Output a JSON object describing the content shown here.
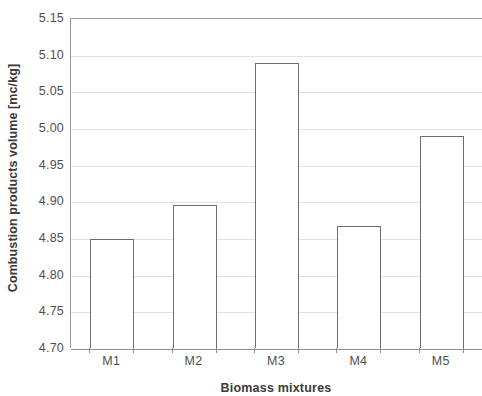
{
  "chart_data": {
    "type": "bar",
    "title": "",
    "subtitle": "",
    "xlabel": "Biomass mixtures",
    "ylabel": "Combustion products volume [mc/kg]",
    "categories": [
      "M1",
      "M2",
      "M3",
      "M4",
      "M5"
    ],
    "values": [
      4.848,
      4.895,
      5.089,
      4.866,
      4.989
    ],
    "ylim": [
      4.7,
      5.15
    ],
    "ytick_values": [
      4.7,
      4.75,
      4.8,
      4.85,
      4.9,
      4.95,
      5.0,
      5.05,
      5.1,
      5.15
    ],
    "ytick_labels": [
      "4.70",
      "4.75",
      "4.80",
      "4.85",
      "4.90",
      "4.95",
      "5.00",
      "5.05",
      "5.10",
      "5.15"
    ],
    "grid": true,
    "grid_axis": "y",
    "legend": false,
    "legend_position": "none",
    "bar_fill_color": "#ffffff",
    "bar_edge_color": "#6d6d6d",
    "gridline_color": "#e2e2e2",
    "axis_color": "#8f8f8f"
  },
  "axes": {
    "y_title": "Combustion products volume [mc/kg]",
    "x_title": "Biomass mixtures"
  }
}
